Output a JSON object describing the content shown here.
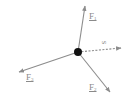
{
  "diagram": {
    "type": "force-diagram",
    "colors": {
      "arrow": "#8c8c8c",
      "particle": "#111111",
      "label": "#8a8a8a"
    },
    "particle": {
      "x": 78,
      "y": 52,
      "r": 4
    },
    "vectors": [
      {
        "id": "F1",
        "base": "F",
        "sub": "1",
        "style": "solid",
        "tip": [
          85,
          6
        ],
        "label_pos": [
          89,
          12
        ]
      },
      {
        "id": "F2",
        "base": "F",
        "sub": "2",
        "style": "solid",
        "tip": [
          110,
          92
        ],
        "label_pos": [
          89,
          83
        ]
      },
      {
        "id": "F3",
        "base": "F",
        "sub": "3",
        "style": "solid",
        "tip": [
          19,
          72
        ],
        "label_pos": [
          26,
          73
        ]
      },
      {
        "id": "s",
        "base": "s",
        "sub": "",
        "style": "dashed",
        "tip": [
          121,
          48
        ],
        "label_pos": [
          103,
          38
        ]
      }
    ]
  }
}
